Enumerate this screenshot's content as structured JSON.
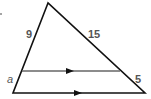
{
  "figure": {
    "type": "triangle-with-parallel-segment",
    "colors": {
      "stroke": "#111111",
      "midline": "#666666",
      "label": "#555555"
    },
    "vertices": {
      "apex": [
        48,
        3
      ],
      "bottom_left": [
        13,
        93
      ],
      "bottom_right": [
        145,
        93
      ]
    },
    "parallel_segment": {
      "from": [
        22,
        71
      ],
      "to": [
        120,
        71
      ]
    },
    "labels": {
      "left_upper": "9",
      "right_upper": "15",
      "left_lower": "a",
      "right_lower": "5"
    }
  }
}
